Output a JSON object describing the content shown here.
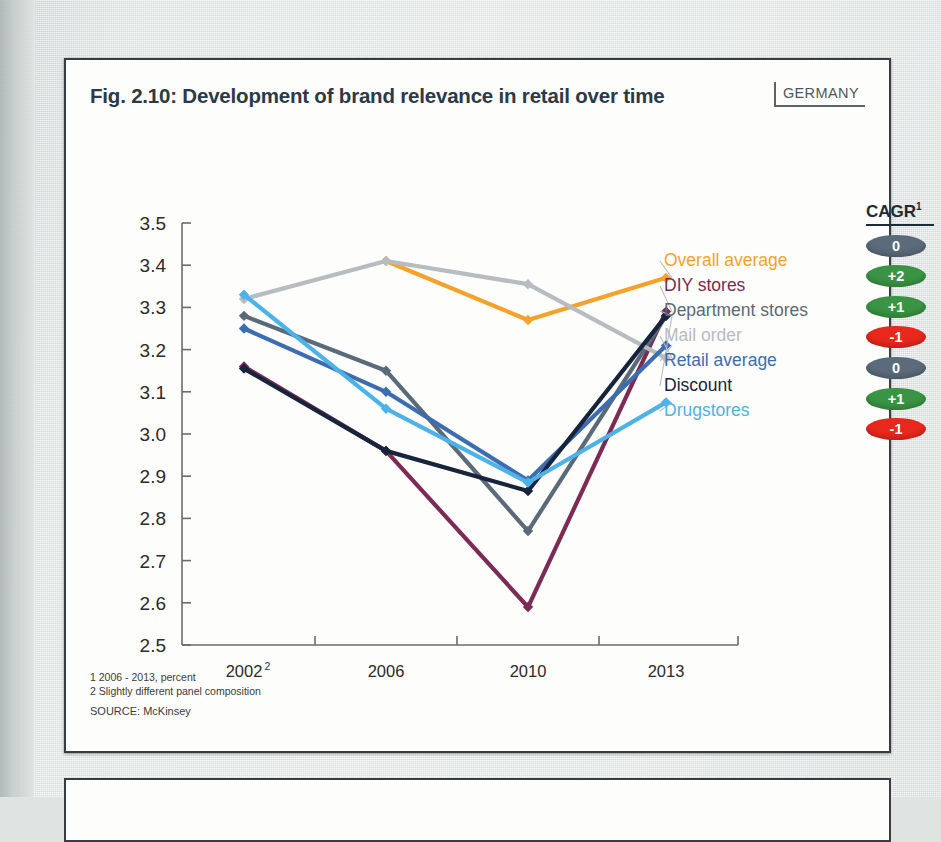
{
  "figure": {
    "title": "Fig. 2.10: Development of brand relevance in retail over time",
    "country_badge": "GERMANY",
    "cagr_header": "CAGR",
    "cagr_header_sup": "1",
    "footnote_1": "1 2006 - 2013, percent",
    "footnote_2": "2 Slightly different panel composition",
    "source": "SOURCE: McKinsey"
  },
  "chart_data": {
    "type": "line",
    "title": "Fig. 2.10: Development of brand relevance in retail over time",
    "xlabel": "",
    "ylabel": "",
    "categories": [
      "2002",
      "2006",
      "2010",
      "2013"
    ],
    "x_tick_labels": [
      "2002",
      "2006",
      "2010",
      "2013"
    ],
    "x_tick_superscripts": [
      "2",
      "",
      "",
      ""
    ],
    "ylim": [
      2.5,
      3.5
    ],
    "y_ticks": [
      "3.5",
      "3.4",
      "3.3",
      "3.2",
      "3.1",
      "3.0",
      "2.9",
      "2.8",
      "2.7",
      "2.6",
      "2.5"
    ],
    "grid": false,
    "legend_position": "right",
    "series": [
      {
        "name": "Overall average",
        "color": "#f5a22b",
        "values": [
          null,
          3.41,
          3.27,
          3.37
        ],
        "cagr": "0",
        "cagr_color": "#5b6b7b"
      },
      {
        "name": "DIY stores",
        "color": "#7d2b54",
        "values": [
          3.16,
          2.96,
          2.59,
          3.29
        ],
        "cagr": "+2",
        "cagr_color": "#3a9443"
      },
      {
        "name": "Department stores",
        "color": "#5a6a78",
        "values": [
          3.28,
          3.15,
          2.77,
          3.28
        ],
        "cagr": "+1",
        "cagr_color": "#3a9443"
      },
      {
        "name": "Mail order",
        "color": "#b6bcc0",
        "values": [
          3.32,
          3.41,
          3.355,
          3.18
        ],
        "cagr": "-1",
        "cagr_color": "#e8281c"
      },
      {
        "name": "Retail average",
        "color": "#3c6db0",
        "values": [
          3.25,
          3.1,
          2.89,
          3.21
        ],
        "cagr": "0",
        "cagr_color": "#5b6b7b"
      },
      {
        "name": "Discount",
        "color": "#17243c",
        "values": [
          3.155,
          2.96,
          2.865,
          3.28
        ],
        "cagr": "+1",
        "cagr_color": "#3a9443"
      },
      {
        "name": "Drugstores",
        "color": "#4db2e8",
        "values": [
          3.33,
          3.06,
          2.885,
          3.075
        ],
        "cagr": "-1",
        "cagr_color": "#e8281c"
      }
    ]
  }
}
